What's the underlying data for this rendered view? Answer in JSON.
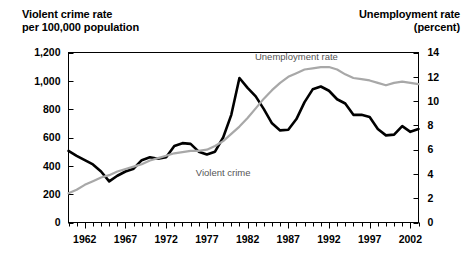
{
  "header": {
    "left_title": "Violent crime rate\nper 100,000 population",
    "right_title": "Unemployment rate\n(percent)"
  },
  "chart_data": {
    "type": "line",
    "xlabel": "",
    "ylabel": "Violent crime rate per 100,000 population",
    "y2label": "Unemployment rate (percent)",
    "xlim": [
      1960,
      2003
    ],
    "ylim": [
      0,
      1200
    ],
    "y2lim": [
      0,
      14
    ],
    "grid": false,
    "legend": "in-plot-labels",
    "left_ticks": [
      "0",
      "200",
      "400",
      "600",
      "800",
      "1,000",
      "1,200"
    ],
    "left_tick_values": [
      0,
      200,
      400,
      600,
      800,
      1000,
      1200
    ],
    "right_ticks": [
      "0",
      "2",
      "4",
      "6",
      "8",
      "10",
      "12",
      "14"
    ],
    "right_tick_values": [
      0,
      2,
      4,
      6,
      8,
      10,
      12,
      14
    ],
    "x_ticks": [
      "1962",
      "1967",
      "1972",
      "1977",
      "1982",
      "1987",
      "1992",
      "1997",
      "2002"
    ],
    "x_tick_values": [
      1962,
      1967,
      1972,
      1977,
      1982,
      1987,
      1992,
      1997,
      2002
    ],
    "x_minor_step": 1,
    "annotations": [
      {
        "text": "Unemployment rate",
        "x": 1988,
        "y": 13.4,
        "axis": "right",
        "color": "#555555"
      },
      {
        "text": "Violent crime",
        "x": 1979,
        "y": 330,
        "axis": "left",
        "color": "#555555"
      }
    ],
    "series": [
      {
        "name": "Violent crime",
        "axis": "left",
        "color": "#000000",
        "x": [
          1960,
          1961,
          1962,
          1963,
          1964,
          1965,
          1966,
          1967,
          1968,
          1969,
          1970,
          1971,
          1972,
          1973,
          1974,
          1975,
          1976,
          1977,
          1978,
          1979,
          1980,
          1981,
          1982,
          1983,
          1984,
          1985,
          1986,
          1987,
          1988,
          1989,
          1990,
          1991,
          1992,
          1993,
          1994,
          1995,
          1996,
          1997,
          1998,
          1999,
          2000,
          2001,
          2002,
          2003
        ],
        "values": [
          505,
          470,
          440,
          410,
          360,
          290,
          330,
          360,
          380,
          440,
          460,
          450,
          460,
          540,
          560,
          555,
          500,
          480,
          500,
          600,
          760,
          1020,
          950,
          890,
          800,
          700,
          650,
          655,
          730,
          850,
          940,
          960,
          930,
          870,
          840,
          760,
          760,
          745,
          660,
          615,
          620,
          680,
          640,
          660
        ]
      },
      {
        "name": "Unemployment rate",
        "axis": "right",
        "color": "#a8a8a8",
        "x": [
          1960,
          1961,
          1962,
          1963,
          1964,
          1965,
          1966,
          1967,
          1968,
          1969,
          1970,
          1971,
          1972,
          1973,
          1974,
          1975,
          1976,
          1977,
          1978,
          1979,
          1980,
          1981,
          1982,
          1983,
          1984,
          1985,
          1986,
          1987,
          1988,
          1989,
          1990,
          1991,
          1992,
          1993,
          1994,
          1995,
          1996,
          1997,
          1998,
          1999,
          2000,
          2001,
          2002,
          2003
        ],
        "values": [
          2.4,
          2.7,
          3.1,
          3.4,
          3.7,
          3.9,
          4.2,
          4.4,
          4.6,
          4.8,
          5.1,
          5.3,
          5.5,
          5.7,
          5.8,
          5.9,
          5.9,
          6.0,
          6.3,
          6.7,
          7.3,
          7.9,
          8.6,
          9.4,
          10.2,
          10.9,
          11.5,
          12.0,
          12.3,
          12.6,
          12.7,
          12.8,
          12.8,
          12.6,
          12.2,
          11.9,
          11.8,
          11.7,
          11.5,
          11.3,
          11.5,
          11.6,
          11.5,
          11.4
        ]
      }
    ]
  }
}
